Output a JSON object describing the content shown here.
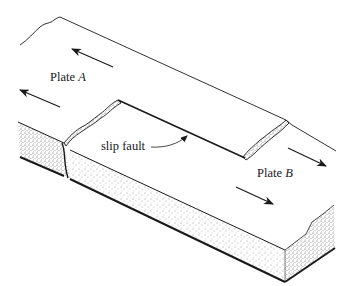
{
  "figure": {
    "type": "block diagram",
    "labels": {
      "plate_a": {
        "prefix": "Plate ",
        "letter": "A"
      },
      "plate_b": {
        "prefix": "Plate ",
        "letter": "B"
      },
      "fault": "slip fault"
    },
    "arrows": {
      "plate_a": {
        "direction": "up-left",
        "count": 2
      },
      "plate_b": {
        "direction": "down-right",
        "count": 2
      }
    },
    "colors": {
      "line": "#1a1a1a",
      "background": "#ffffff",
      "stipple": "#555555"
    }
  }
}
